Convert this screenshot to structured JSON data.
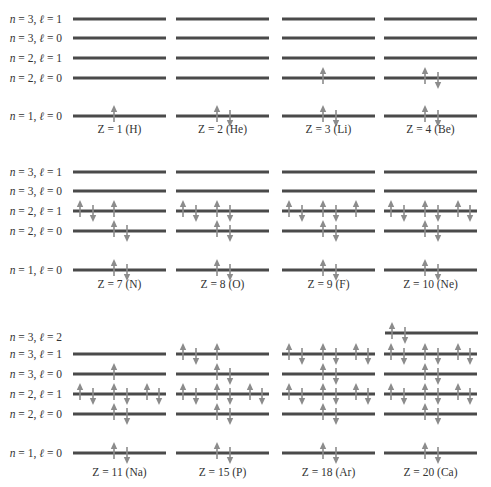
{
  "figure": {
    "columns_x": [
      73,
      176,
      282,
      384
    ],
    "line_width": 93,
    "slot_offsets": {
      "s": [
        41,
        54
      ],
      "p": [
        7,
        20,
        41,
        54,
        74,
        86
      ],
      "top": [
        7,
        20
      ]
    },
    "colors": {
      "line": "#4a4a4a",
      "arrow": "#8c8c8c",
      "text": "#333333"
    },
    "rows": [
      {
        "labels": [
          {
            "n": "3",
            "l": "1",
            "y": 19
          },
          {
            "n": "3",
            "l": "0",
            "y": 38
          },
          {
            "n": "2",
            "l": "1",
            "y": 58
          },
          {
            "n": "2",
            "l": "0",
            "y": 78
          },
          {
            "n": "1",
            "l": "0",
            "y": 116
          }
        ],
        "caption_y": 133,
        "atoms": [
          {
            "caption": "Z = 1 (H)",
            "levels": [
              {
                "y": 19,
                "kind": "p",
                "spins": []
              },
              {
                "y": 38,
                "kind": "s",
                "spins": []
              },
              {
                "y": 58,
                "kind": "p",
                "spins": []
              },
              {
                "y": 78,
                "kind": "s",
                "spins": []
              },
              {
                "y": 116,
                "kind": "s",
                "spins": [
                  "up"
                ]
              }
            ]
          },
          {
            "caption": "Z = 2 (He)",
            "levels": [
              {
                "y": 19,
                "kind": "p",
                "spins": []
              },
              {
                "y": 38,
                "kind": "s",
                "spins": []
              },
              {
                "y": 58,
                "kind": "p",
                "spins": []
              },
              {
                "y": 78,
                "kind": "s",
                "spins": []
              },
              {
                "y": 116,
                "kind": "s",
                "spins": [
                  "up",
                  "down"
                ]
              }
            ]
          },
          {
            "caption": "Z = 3 (Li)",
            "levels": [
              {
                "y": 19,
                "kind": "p",
                "spins": []
              },
              {
                "y": 38,
                "kind": "s",
                "spins": []
              },
              {
                "y": 58,
                "kind": "p",
                "spins": []
              },
              {
                "y": 78,
                "kind": "s",
                "spins": [
                  "up"
                ]
              },
              {
                "y": 116,
                "kind": "s",
                "spins": [
                  "up",
                  "down"
                ]
              }
            ]
          },
          {
            "caption": "Z = 4 (Be)",
            "levels": [
              {
                "y": 19,
                "kind": "p",
                "spins": []
              },
              {
                "y": 38,
                "kind": "s",
                "spins": []
              },
              {
                "y": 58,
                "kind": "p",
                "spins": []
              },
              {
                "y": 78,
                "kind": "s",
                "spins": [
                  "up",
                  "down"
                ]
              },
              {
                "y": 116,
                "kind": "s",
                "spins": [
                  "up",
                  "down"
                ]
              }
            ]
          }
        ]
      },
      {
        "labels": [
          {
            "n": "3",
            "l": "1",
            "y": 172
          },
          {
            "n": "3",
            "l": "0",
            "y": 191
          },
          {
            "n": "2",
            "l": "1",
            "y": 211
          },
          {
            "n": "2",
            "l": "0",
            "y": 231
          },
          {
            "n": "1",
            "l": "0",
            "y": 270
          }
        ],
        "caption_y": 288,
        "atoms": [
          {
            "caption": "Z = 7 (N)",
            "levels": [
              {
                "y": 172,
                "kind": "p",
                "spins": []
              },
              {
                "y": 191,
                "kind": "s",
                "spins": []
              },
              {
                "y": 211,
                "kind": "p",
                "spins": [
                  "up",
                  "down",
                  "up"
                ]
              },
              {
                "y": 231,
                "kind": "s",
                "spins": [
                  "up",
                  "down"
                ]
              },
              {
                "y": 270,
                "kind": "s",
                "spins": [
                  "up",
                  "down"
                ]
              }
            ]
          },
          {
            "caption": "Z = 8 (O)",
            "levels": [
              {
                "y": 172,
                "kind": "p",
                "spins": []
              },
              {
                "y": 191,
                "kind": "s",
                "spins": []
              },
              {
                "y": 211,
                "kind": "p",
                "spins": [
                  "up",
                  "down",
                  "up",
                  "down"
                ]
              },
              {
                "y": 231,
                "kind": "s",
                "spins": [
                  "up",
                  "down"
                ]
              },
              {
                "y": 270,
                "kind": "s",
                "spins": [
                  "up",
                  "down"
                ]
              }
            ]
          },
          {
            "caption": "Z = 9 (F)",
            "levels": [
              {
                "y": 172,
                "kind": "p",
                "spins": []
              },
              {
                "y": 191,
                "kind": "s",
                "spins": []
              },
              {
                "y": 211,
                "kind": "p",
                "spins": [
                  "up",
                  "down",
                  "up",
                  "down",
                  "up"
                ]
              },
              {
                "y": 231,
                "kind": "s",
                "spins": [
                  "up",
                  "down"
                ]
              },
              {
                "y": 270,
                "kind": "s",
                "spins": [
                  "up",
                  "down"
                ]
              }
            ]
          },
          {
            "caption": "Z = 10 (Ne)",
            "levels": [
              {
                "y": 172,
                "kind": "p",
                "spins": []
              },
              {
                "y": 191,
                "kind": "s",
                "spins": []
              },
              {
                "y": 211,
                "kind": "p",
                "spins": [
                  "up",
                  "down",
                  "up",
                  "down",
                  "up",
                  "down"
                ]
              },
              {
                "y": 231,
                "kind": "s",
                "spins": [
                  "up",
                  "down"
                ]
              },
              {
                "y": 270,
                "kind": "s",
                "spins": [
                  "up",
                  "down"
                ]
              }
            ]
          }
        ]
      },
      {
        "labels": [
          {
            "n": "3",
            "l": "2",
            "y": 337
          },
          {
            "n": "3",
            "l": "1",
            "y": 354
          },
          {
            "n": "3",
            "l": "0",
            "y": 374
          },
          {
            "n": "2",
            "l": "1",
            "y": 394
          },
          {
            "n": "2",
            "l": "0",
            "y": 414
          },
          {
            "n": "1",
            "l": "0",
            "y": 453
          }
        ],
        "caption_y": 476,
        "atoms": [
          {
            "caption": "Z = 11 (Na)",
            "levels": [
              {
                "y": 354,
                "kind": "p",
                "spins": []
              },
              {
                "y": 374,
                "kind": "s",
                "spins": [
                  "up"
                ]
              },
              {
                "y": 394,
                "kind": "p",
                "spins": [
                  "up",
                  "down",
                  "up",
                  "down",
                  "up",
                  "down"
                ]
              },
              {
                "y": 414,
                "kind": "s",
                "spins": [
                  "up",
                  "down"
                ]
              },
              {
                "y": 453,
                "kind": "s",
                "spins": [
                  "up",
                  "down"
                ]
              }
            ]
          },
          {
            "caption": "Z = 15 (P)",
            "levels": [
              {
                "y": 354,
                "kind": "p",
                "spins": [
                  "up",
                  "down",
                  "up"
                ]
              },
              {
                "y": 374,
                "kind": "s",
                "spins": [
                  "up",
                  "down"
                ]
              },
              {
                "y": 394,
                "kind": "p",
                "spins": [
                  "up",
                  "down",
                  "up",
                  "down",
                  "up",
                  "down"
                ]
              },
              {
                "y": 414,
                "kind": "s",
                "spins": [
                  "up",
                  "down"
                ]
              },
              {
                "y": 453,
                "kind": "s",
                "spins": [
                  "up",
                  "down"
                ]
              }
            ]
          },
          {
            "caption": "Z = 18 (Ar)",
            "levels": [
              {
                "y": 354,
                "kind": "p",
                "spins": [
                  "up",
                  "down",
                  "up",
                  "down",
                  "up",
                  "down"
                ]
              },
              {
                "y": 374,
                "kind": "s",
                "spins": [
                  "up",
                  "down"
                ]
              },
              {
                "y": 394,
                "kind": "p",
                "spins": [
                  "up",
                  "down",
                  "up",
                  "down",
                  "up",
                  "down"
                ]
              },
              {
                "y": 414,
                "kind": "s",
                "spins": [
                  "up",
                  "down"
                ]
              },
              {
                "y": 453,
                "kind": "s",
                "spins": [
                  "up",
                  "down"
                ]
              }
            ]
          },
          {
            "caption": "Z = 20 (Ca)",
            "levels": [
              {
                "y": 333,
                "kind": "top",
                "spins": [
                  "up",
                  "down"
                ]
              },
              {
                "y": 354,
                "kind": "p",
                "spins": [
                  "up",
                  "down",
                  "up",
                  "down",
                  "up",
                  "down"
                ]
              },
              {
                "y": 374,
                "kind": "s",
                "spins": [
                  "up",
                  "down"
                ]
              },
              {
                "y": 394,
                "kind": "p",
                "spins": [
                  "up",
                  "down",
                  "up",
                  "down",
                  "up",
                  "down"
                ]
              },
              {
                "y": 414,
                "kind": "s",
                "spins": [
                  "up",
                  "down"
                ]
              },
              {
                "y": 453,
                "kind": "s",
                "spins": [
                  "up",
                  "down"
                ]
              }
            ]
          }
        ]
      }
    ]
  }
}
